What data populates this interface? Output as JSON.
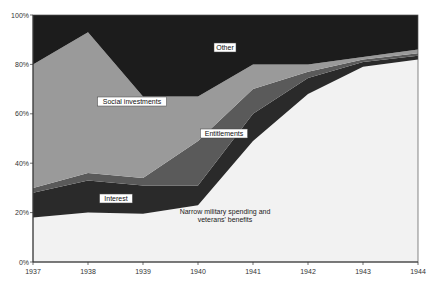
{
  "chart_data": {
    "type": "area",
    "stacked": true,
    "percent": true,
    "title": "",
    "xlabel": "",
    "ylabel": "",
    "ylim": [
      0,
      100
    ],
    "grid": false,
    "legend": "inline labels",
    "categories": [
      "1937",
      "1938",
      "1939",
      "1940",
      "1941",
      "1942",
      "1943",
      "1944"
    ],
    "y_ticks": [
      "0%",
      "20%",
      "40%",
      "60%",
      "80%",
      "100%"
    ],
    "series": [
      {
        "name": "Narrow military spending and veterans' benefits",
        "label_lines": [
          "Narrow military spending and",
          "veterans' benefits"
        ],
        "color": "#f2f2f2",
        "values": [
          18,
          20,
          19.5,
          23,
          49,
          68,
          79,
          82
        ]
      },
      {
        "name": "Interest",
        "label_lines": [
          "Interest"
        ],
        "color": "#2a2a2a",
        "values": [
          10,
          13,
          11.5,
          8,
          11,
          6.5,
          2,
          1.5
        ]
      },
      {
        "name": "Entitlements",
        "label_lines": [
          "Entitlements"
        ],
        "color": "#5a5a5a",
        "values": [
          2,
          3,
          3,
          18,
          10,
          2.5,
          1,
          1
        ]
      },
      {
        "name": "Social investments",
        "label_lines": [
          "Social investments"
        ],
        "color": "#9a9a9a",
        "values": [
          50,
          57,
          33,
          18,
          10,
          3,
          1,
          1.5
        ]
      },
      {
        "name": "Other",
        "label_lines": [
          "Other"
        ],
        "color": "#1c1c1c",
        "values": [
          20,
          7,
          33,
          33,
          20,
          20,
          17,
          14
        ]
      }
    ]
  }
}
